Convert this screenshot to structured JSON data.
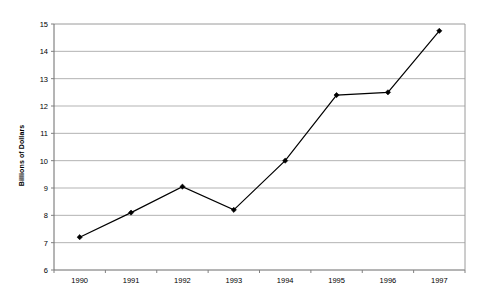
{
  "chart_data": {
    "type": "line",
    "title": "",
    "xlabel": "",
    "ylabel": "Billions of Dollars",
    "categories": [
      "1990",
      "1991",
      "1992",
      "1993",
      "1994",
      "1995",
      "1996",
      "1997"
    ],
    "values": [
      7.2,
      8.1,
      9.05,
      8.2,
      10.0,
      12.4,
      12.5,
      14.75
    ],
    "series": [
      {
        "name": "",
        "values": [
          7.2,
          8.1,
          9.05,
          8.2,
          10.0,
          12.4,
          12.5,
          14.75
        ]
      }
    ],
    "ylim": [
      6,
      15
    ],
    "yticks": [
      6,
      7,
      8,
      9,
      10,
      11,
      12,
      13,
      14,
      15
    ],
    "ytick_labels": [
      "6",
      "7",
      "8",
      "9",
      "10",
      "11",
      "12",
      "13",
      "14",
      "15"
    ],
    "grid": true,
    "grid_axis": "y",
    "legend": false,
    "legend_position": "none",
    "marker": "diamond",
    "colors": {
      "line": "#000000",
      "marker": "#000000",
      "grid": "#b3b3b3",
      "axis": "#808080",
      "background": "#ffffff",
      "text": "#000000"
    }
  },
  "plot_area": {
    "left": 54,
    "right": 465,
    "top": 24,
    "bottom": 270
  }
}
